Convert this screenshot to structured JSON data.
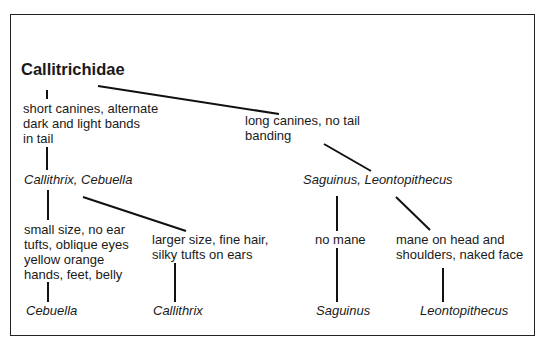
{
  "diagram": {
    "type": "taxonomic-tree",
    "root": "Callitrichidae",
    "nodes": {
      "root": {
        "label": "Callitrichidae"
      },
      "trait_short_canines": {
        "label": "short canines, alternate\ndark and light bands\nin tail"
      },
      "trait_long_canines": {
        "label": "long canines, no tail\nbanding"
      },
      "taxon_callithrix_cebuella": {
        "label": "Callithrix, Cebuella"
      },
      "taxon_saguinus_leontopithecus": {
        "label": "Saguinus, Leontopithecus"
      },
      "trait_small_size": {
        "label": "small size, no ear\ntufts, oblique eyes\nyellow orange\nhands, feet, belly"
      },
      "trait_larger_size": {
        "label": "larger size, fine hair,\nsilky tufts on ears"
      },
      "trait_no_mane": {
        "label": "no mane"
      },
      "trait_mane": {
        "label": "mane on head and\nshoulders, naked face"
      },
      "taxon_cebuella": {
        "label": "Cebuella"
      },
      "taxon_callithrix": {
        "label": "Callithrix"
      },
      "taxon_saguinus": {
        "label": "Saguinus"
      },
      "taxon_leontopithecus": {
        "label": "Leontopithecus"
      }
    },
    "edges": [
      [
        "root",
        "trait_short_canines"
      ],
      [
        "root",
        "trait_long_canines"
      ],
      [
        "trait_short_canines",
        "taxon_callithrix_cebuella"
      ],
      [
        "trait_long_canines",
        "taxon_saguinus_leontopithecus"
      ],
      [
        "taxon_callithrix_cebuella",
        "trait_small_size"
      ],
      [
        "taxon_callithrix_cebuella",
        "trait_larger_size"
      ],
      [
        "taxon_saguinus_leontopithecus",
        "trait_no_mane"
      ],
      [
        "taxon_saguinus_leontopithecus",
        "trait_mane"
      ],
      [
        "trait_small_size",
        "taxon_cebuella"
      ],
      [
        "trait_larger_size",
        "taxon_callithrix"
      ],
      [
        "trait_no_mane",
        "taxon_saguinus"
      ],
      [
        "trait_mane",
        "taxon_leontopithecus"
      ]
    ]
  }
}
